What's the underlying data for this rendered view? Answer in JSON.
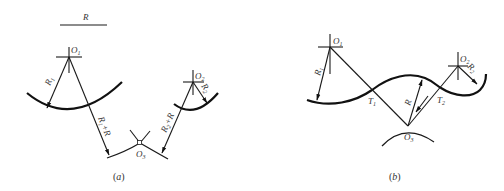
{
  "figure": {
    "panels": [
      {
        "id": "a",
        "caption": "(a)",
        "caption_letter": "a",
        "reference_length_label": "R",
        "centers": [
          {
            "name": "O",
            "sub": "1"
          },
          {
            "name": "O",
            "sub": "2"
          },
          {
            "name": "O",
            "sub": "3"
          }
        ],
        "radius_labels": [
          {
            "main": "R",
            "sub": "1"
          },
          {
            "main": "R",
            "sub": "2"
          },
          {
            "main": "R",
            "sub": "1",
            "suffix": "+R"
          },
          {
            "main": "R",
            "sub": "2",
            "suffix": "+R"
          }
        ]
      },
      {
        "id": "b",
        "caption": "(b)",
        "caption_letter": "b",
        "centers": [
          {
            "name": "O",
            "sub": "1"
          },
          {
            "name": "O",
            "sub": "2"
          },
          {
            "name": "O",
            "sub": "3"
          }
        ],
        "tangent_points": [
          {
            "name": "T",
            "sub": "1"
          },
          {
            "name": "T",
            "sub": "2"
          }
        ],
        "radius_labels": [
          {
            "main": "R",
            "sub": "1"
          },
          {
            "main": "R",
            "sub": "2"
          },
          {
            "main": "R",
            "sub": ""
          }
        ]
      }
    ]
  }
}
